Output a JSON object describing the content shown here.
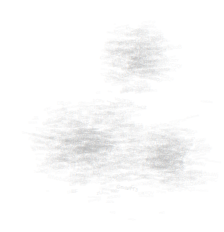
{
  "canvas": {
    "width": 224,
    "height": 232,
    "background_color": "#ffffff",
    "description": "Word-cloud / text-scatter plot rendered at near-white contrast; no glyph text is legible at native resolution."
  },
  "render": {
    "seed": 20240517,
    "text_color": "#b9b9b9",
    "min_opacity": 0.1,
    "max_opacity": 0.42,
    "min_font_px": 2.2,
    "max_font_px": 5.6,
    "token_alphabet": "abcdefghijklmnopqrstuvwxyzABCDEFGHIJKLMNOPQRSTUVWXYZ0123456789",
    "min_token_chars": 2,
    "max_token_chars": 9,
    "max_rotation_deg": 14
  },
  "chart_data": {
    "type": "scatter",
    "title": "",
    "subtitle": "",
    "xlabel": "",
    "ylabel": "",
    "legend": [],
    "annotations": [],
    "grid": false,
    "axes_visible": false,
    "tick_labels_visible": false,
    "xlim": [
      0,
      224
    ],
    "ylim": [
      0,
      232
    ],
    "note": "Two unlabeled density clusters of faint text tokens on a white field. No axis, legend, tick or annotation text is rendered in the image.",
    "clusters": [
      {
        "id": "upper-cluster",
        "label": "",
        "shape": "round",
        "center_x": 130,
        "center_y": 57,
        "radius_x": 32,
        "radius_y": 35,
        "bbox": [
          98,
          22,
          162,
          92
        ],
        "token_count": 640,
        "peak_density": 0.82,
        "edge_falloff": 1.7
      },
      {
        "id": "lower-left-lobe",
        "label": "",
        "shape": "broad-irregular",
        "center_x": 82,
        "center_y": 142,
        "radius_x": 58,
        "radius_y": 42,
        "bbox": [
          25,
          100,
          140,
          188
        ],
        "token_count": 1150,
        "peak_density": 0.9,
        "edge_falloff": 1.5
      },
      {
        "id": "lower-right-lobe",
        "label": "",
        "shape": "round-irregular",
        "center_x": 158,
        "center_y": 156,
        "radius_x": 40,
        "radius_y": 34,
        "bbox": [
          122,
          120,
          196,
          192
        ],
        "token_count": 700,
        "peak_density": 0.84,
        "edge_falloff": 1.6
      },
      {
        "id": "upper-mid-bridge",
        "label": "",
        "shape": "sparse-bridge",
        "center_x": 112,
        "center_y": 99,
        "radius_x": 26,
        "radius_y": 14,
        "bbox": [
          88,
          86,
          140,
          112
        ],
        "token_count": 95,
        "peak_density": 0.34,
        "edge_falloff": 2.0
      },
      {
        "id": "lower-tail",
        "label": "",
        "shape": "sparse-tail",
        "center_x": 106,
        "center_y": 184,
        "radius_x": 46,
        "radius_y": 20,
        "bbox": [
          58,
          166,
          158,
          204
        ],
        "token_count": 120,
        "peak_density": 0.3,
        "edge_falloff": 2.2
      }
    ],
    "outliers": [
      {
        "x": 201,
        "y": 100,
        "size": 3.0,
        "opacity": 0.16
      },
      {
        "x": 205,
        "y": 159,
        "size": 2.8,
        "opacity": 0.14
      },
      {
        "x": 34,
        "y": 171,
        "size": 3.2,
        "opacity": 0.18
      },
      {
        "x": 106,
        "y": 201,
        "size": 3.4,
        "opacity": 0.2
      },
      {
        "x": 110,
        "y": 211,
        "size": 2.8,
        "opacity": 0.15
      },
      {
        "x": 159,
        "y": 212,
        "size": 3.0,
        "opacity": 0.16
      },
      {
        "x": 128,
        "y": 219,
        "size": 2.6,
        "opacity": 0.13
      },
      {
        "x": 88,
        "y": 196,
        "size": 2.8,
        "opacity": 0.15
      },
      {
        "x": 186,
        "y": 117,
        "size": 3.0,
        "opacity": 0.16
      },
      {
        "x": 46,
        "y": 191,
        "size": 2.7,
        "opacity": 0.14
      },
      {
        "x": 196,
        "y": 190,
        "size": 2.6,
        "opacity": 0.13
      },
      {
        "x": 22,
        "y": 131,
        "size": 2.9,
        "opacity": 0.15
      }
    ]
  }
}
